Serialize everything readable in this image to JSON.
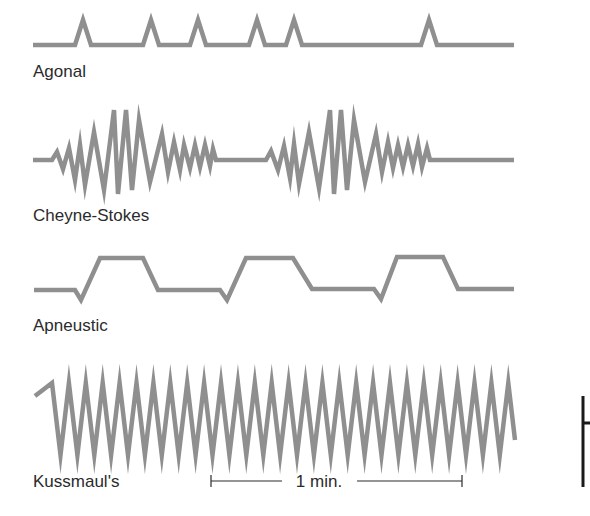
{
  "colors": {
    "trace": "#8f8f8f",
    "text": "#2b2b2b",
    "bar": "#1a1a1a",
    "background": "#ffffff"
  },
  "patterns": [
    {
      "id": "agonal",
      "label": "Agonal",
      "label_pos": [
        33,
        77
      ],
      "points": [
        [
          33,
          45
        ],
        [
          75,
          45
        ],
        [
          83,
          20
        ],
        [
          91,
          45
        ],
        [
          143,
          45
        ],
        [
          151,
          20
        ],
        [
          159,
          45
        ],
        [
          190,
          45
        ],
        [
          198,
          20
        ],
        [
          206,
          45
        ],
        [
          249,
          45
        ],
        [
          257,
          20
        ],
        [
          265,
          45
        ],
        [
          286,
          45
        ],
        [
          294,
          20
        ],
        [
          302,
          45
        ],
        [
          421,
          45
        ],
        [
          429,
          20
        ],
        [
          437,
          45
        ],
        [
          514,
          45
        ]
      ]
    },
    {
      "id": "cheyne-stokes",
      "label": "Cheyne-Stokes",
      "label_pos": [
        33,
        221
      ],
      "points": [
        [
          33,
          160
        ],
        [
          52,
          160
        ],
        [
          57,
          152
        ],
        [
          63,
          169
        ],
        [
          69,
          148
        ],
        [
          75,
          180
        ],
        [
          80,
          145
        ],
        [
          85,
          185
        ],
        [
          94,
          132
        ],
        [
          104,
          190
        ],
        [
          114,
          110
        ],
        [
          118,
          194
        ],
        [
          126,
          110
        ],
        [
          132,
          190
        ],
        [
          139,
          120
        ],
        [
          150,
          182
        ],
        [
          162,
          134
        ],
        [
          168,
          172
        ],
        [
          174,
          142
        ],
        [
          180,
          170
        ],
        [
          184,
          145
        ],
        [
          190,
          168
        ],
        [
          195,
          145
        ],
        [
          200,
          167
        ],
        [
          205,
          145
        ],
        [
          210,
          166
        ],
        [
          213,
          149
        ],
        [
          216,
          160
        ],
        [
          266,
          160
        ],
        [
          271,
          151
        ],
        [
          278,
          170
        ],
        [
          284,
          146
        ],
        [
          290,
          178
        ],
        [
          294,
          144
        ],
        [
          299,
          184
        ],
        [
          309,
          132
        ],
        [
          319,
          188
        ],
        [
          330,
          110
        ],
        [
          334,
          194
        ],
        [
          341,
          110
        ],
        [
          347,
          190
        ],
        [
          354,
          120
        ],
        [
          365,
          182
        ],
        [
          376,
          134
        ],
        [
          382,
          172
        ],
        [
          388,
          142
        ],
        [
          393,
          168
        ],
        [
          398,
          145
        ],
        [
          403,
          167
        ],
        [
          408,
          145
        ],
        [
          413,
          166
        ],
        [
          418,
          144
        ],
        [
          422,
          167
        ],
        [
          427,
          148
        ],
        [
          430,
          160
        ],
        [
          514,
          160
        ]
      ]
    },
    {
      "id": "apneustic",
      "label": "Apneustic",
      "label_pos": [
        33,
        331
      ],
      "points": [
        [
          34,
          290
        ],
        [
          75,
          290
        ],
        [
          81,
          300
        ],
        [
          100,
          258
        ],
        [
          143,
          258
        ],
        [
          158,
          290
        ],
        [
          220,
          290
        ],
        [
          227,
          300
        ],
        [
          246,
          258
        ],
        [
          293,
          258
        ],
        [
          312,
          289
        ],
        [
          374,
          289
        ],
        [
          381,
          299
        ],
        [
          397,
          257
        ],
        [
          443,
          257
        ],
        [
          458,
          289
        ],
        [
          514,
          289
        ]
      ]
    },
    {
      "id": "kussmaul",
      "label": "Kussmaul's",
      "label_pos": [
        33,
        487
      ],
      "start": [
        35,
        396
      ],
      "first_peak_x": 52,
      "peak_count": 28,
      "period": 16.9,
      "peak_y": 383,
      "trough_y": 455,
      "end": [
        515,
        440
      ]
    }
  ],
  "scale_bar": {
    "label": "1 min.",
    "x1": 211,
    "x2": 462,
    "y": 481,
    "gap_left": 282,
    "gap_right": 357,
    "label_x": 319
  },
  "side_bar": {
    "x": 583,
    "y1": 396,
    "y2": 487,
    "tick_y": 423,
    "tick_len": 8
  }
}
